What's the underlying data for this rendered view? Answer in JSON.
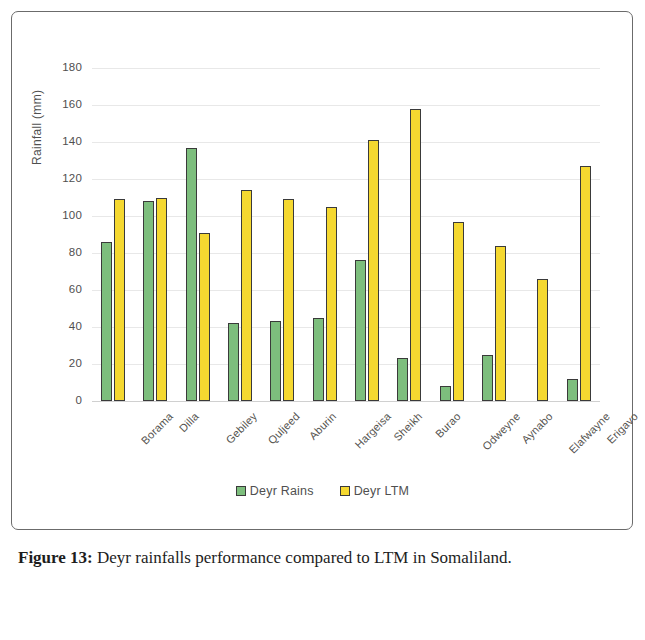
{
  "figure": {
    "caption_label": "Figure 13:",
    "caption_text": " Deyr rainfalls performance compared to LTM in Somaliland."
  },
  "chart_data": {
    "type": "bar",
    "title": "",
    "xlabel": "",
    "ylabel": "Rainfall (mm)",
    "ylim": [
      0,
      180
    ],
    "ytick_step": 20,
    "yticks": [
      "0",
      "20",
      "40",
      "60",
      "80",
      "100",
      "120",
      "140",
      "160",
      "180"
    ],
    "grid": true,
    "legend_position": "bottom-center",
    "categories": [
      "Borama",
      "Dilla",
      "Gebiley",
      "Quljeed",
      "Aburin",
      "Hargeisa",
      "Sheikh",
      "Burao",
      "Odweyne",
      "Aynabo",
      "Elafwayne",
      "Erigavo"
    ],
    "series": [
      {
        "name": "Deyr Rains",
        "color": "#7DBE7D",
        "values": [
          86,
          108,
          137,
          42,
          43,
          45,
          76,
          23,
          8,
          25,
          0,
          12
        ]
      },
      {
        "name": "Deyr LTM",
        "color": "#F5D830",
        "values": [
          109,
          110,
          91,
          114,
          109,
          105,
          141,
          158,
          97,
          84,
          66,
          127
        ]
      }
    ]
  }
}
